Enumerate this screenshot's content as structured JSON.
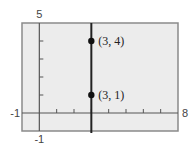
{
  "chart_data": {
    "type": "line",
    "title": "",
    "xlabel": "",
    "ylabel": "",
    "xlim": [
      -1,
      8
    ],
    "ylim": [
      -1,
      5
    ],
    "window_labels": {
      "xmin": "-1",
      "xmax": "8",
      "ymin": "-1",
      "ymax": "5"
    },
    "xticks": [
      1,
      2,
      3,
      4,
      5,
      6,
      7
    ],
    "yticks": [
      1,
      2,
      3,
      4
    ],
    "grid": false,
    "series": [
      {
        "name": "x = 3",
        "type": "vertical-line",
        "x": 3,
        "color": "#222222"
      }
    ],
    "points": [
      {
        "x": 3,
        "y": 4,
        "label": "(3, 4)"
      },
      {
        "x": 3,
        "y": 1,
        "label": "(3, 1)"
      }
    ]
  },
  "colors": {
    "background": "#ececec",
    "frame": "#8a8a8a",
    "axis": "#555555",
    "line": "#222222"
  }
}
